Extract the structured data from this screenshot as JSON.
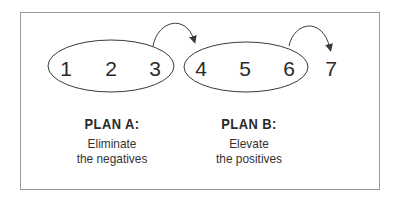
{
  "diagram": {
    "border_color": "#9a9a9a",
    "stroke_color": "#3a3a3a",
    "numbers": [
      {
        "label": "1",
        "group": "A"
      },
      {
        "label": "2",
        "group": "A"
      },
      {
        "label": "3",
        "group": "A"
      },
      {
        "label": "4",
        "group": "B"
      },
      {
        "label": "5",
        "group": "B"
      },
      {
        "label": "6",
        "group": "B"
      },
      {
        "label": "7",
        "group": "none"
      }
    ],
    "ovals": [
      {
        "name": "plan-a-oval",
        "contains": [
          "1",
          "2",
          "3"
        ]
      },
      {
        "name": "plan-b-oval",
        "contains": [
          "4",
          "5",
          "6"
        ]
      }
    ],
    "arrows": [
      {
        "from": "3",
        "to": "4"
      },
      {
        "from": "6",
        "to": "7"
      }
    ],
    "plans": [
      {
        "title": "PLAN A:",
        "line1": "Eliminate",
        "line2": "the negatives"
      },
      {
        "title": "PLAN B:",
        "line1": "Elevate",
        "line2": "the positives"
      }
    ]
  }
}
